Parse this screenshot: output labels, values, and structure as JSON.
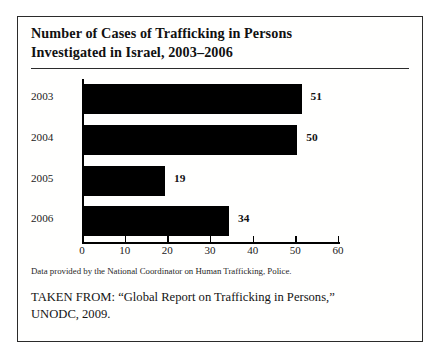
{
  "figure": {
    "title_lines": [
      "Number of Cases of Trafficking in Persons",
      "Investigated in Israel, 2003–2006"
    ],
    "source_note": "Data provided by the National Coordinator on Human Trafficking, Police.",
    "taken_from_lines": [
      "TAKEN FROM: “Global Report on Trafficking in Persons,”",
      "UNODC, 2009."
    ],
    "bar_color": "#000000",
    "frame_color": "#2b2b2b"
  },
  "chart_data": {
    "type": "bar",
    "orientation": "horizontal",
    "title": "Number of Cases of Trafficking in Persons Investigated in Israel, 2003–2006",
    "categories": [
      "2003",
      "2004",
      "2005",
      "2006"
    ],
    "values": [
      51,
      50,
      19,
      34
    ],
    "value_labels": [
      "51",
      "50",
      "19",
      "34"
    ],
    "xlabel": "",
    "ylabel": "",
    "xlim": [
      0,
      60
    ],
    "xticks": [
      0,
      10,
      20,
      30,
      40,
      50,
      60
    ],
    "xtick_labels": [
      "0",
      "10",
      "20",
      "30",
      "40",
      "50",
      "60"
    ],
    "grid": false,
    "legend": false,
    "series": [
      {
        "name": "Cases investigated",
        "values": [
          51,
          50,
          19,
          34
        ]
      }
    ]
  }
}
